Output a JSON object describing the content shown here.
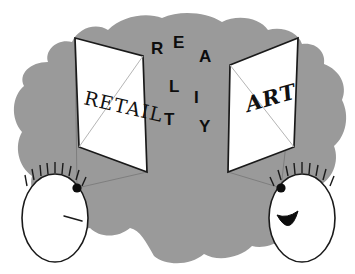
{
  "canvas": {
    "width": 355,
    "height": 274,
    "background_color": "#ffffff"
  },
  "colors": {
    "blob_gray": "#9a9a9a",
    "panel_white": "#ffffff",
    "ink_black": "#1a1a1a",
    "diagonal_gray": "#b5b5b5",
    "shadow_gray": "#6f6f6f"
  },
  "scene": {
    "title": "Retail and Art facing Reality",
    "blob_label": "gray-background-blob"
  },
  "panels": [
    {
      "id": "left-panel",
      "word": "RETAIL",
      "rotation_deg": 13,
      "text_x": 83,
      "text_y": 104,
      "shape_points": "75,38 143,56 147,172 79,147",
      "diagonal_points": "79,147 143,56"
    },
    {
      "id": "right-panel",
      "word": "ART",
      "rotation_deg": -16,
      "text_x": 248,
      "text_y": 112,
      "shape_points": "230,65 298,38 294,147 228,172",
      "diagonal_points": "230,65 294,147"
    }
  ],
  "reality": {
    "word": "REALITY",
    "letters": [
      {
        "char": "R",
        "x": 151,
        "y": 54
      },
      {
        "char": "E",
        "x": 173,
        "y": 48
      },
      {
        "char": "A",
        "x": 199,
        "y": 62
      },
      {
        "char": "L",
        "x": 169,
        "y": 92
      },
      {
        "char": "I",
        "x": 194,
        "y": 103
      },
      {
        "char": "T",
        "x": 164,
        "y": 125
      },
      {
        "char": "Y",
        "x": 199,
        "y": 132
      }
    ]
  },
  "faces": [
    {
      "id": "left-face",
      "expression": "frowning",
      "center_x": 55,
      "center_y": 218,
      "radius_x": 33,
      "radius_y": 44,
      "eye_x": 77,
      "eye_y": 188,
      "eye_r": 4.6,
      "mouth_type": "line",
      "mouth_path": "M 64,216 L 82,221"
    },
    {
      "id": "right-face",
      "expression": "smiling",
      "center_x": 302,
      "center_y": 218,
      "radius_x": 33,
      "radius_y": 44,
      "eye_x": 281,
      "eye_y": 188,
      "eye_r": 4.6,
      "mouth_type": "smile",
      "mouth_path": "M 279,216 Q 290,235 297,212 Q 288,219 279,216 Z"
    }
  ],
  "sight_lines": [
    {
      "id": "left-eye-to-panel-top",
      "path": "M 77,188 L 75,38"
    },
    {
      "id": "left-eye-to-panel-bottom",
      "path": "M 77,188 L 147,172"
    },
    {
      "id": "right-eye-to-panel-top",
      "path": "M 281,188 L 298,38"
    },
    {
      "id": "right-eye-to-panel-bottom",
      "path": "M 281,188 L 228,172"
    }
  ],
  "hair": {
    "left_strand_count": 9,
    "right_strand_count": 9,
    "strand_length": 11
  }
}
